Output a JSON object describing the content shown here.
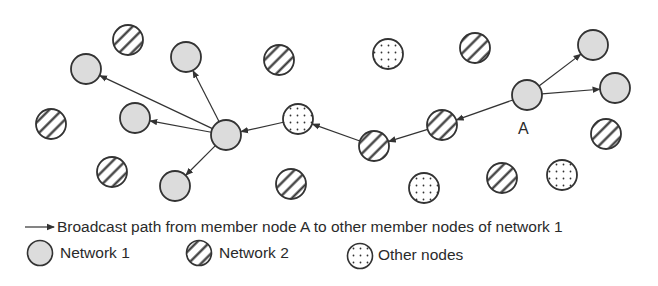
{
  "colors": {
    "stroke": "#333333",
    "network1_fill": "#dcdcdc",
    "background": "#ffffff"
  },
  "node_label_A": "A",
  "nodes": [
    {
      "id": "n1",
      "type": "network2",
      "x": 128,
      "y": 40
    },
    {
      "id": "n2",
      "type": "network1",
      "x": 86,
      "y": 69
    },
    {
      "id": "n3",
      "type": "network1",
      "x": 186,
      "y": 57
    },
    {
      "id": "n4",
      "type": "network2",
      "x": 279,
      "y": 60
    },
    {
      "id": "n5",
      "type": "network2",
      "x": 51,
      "y": 124
    },
    {
      "id": "n6",
      "type": "network1",
      "x": 135,
      "y": 118
    },
    {
      "id": "hub",
      "type": "network1",
      "x": 226,
      "y": 135
    },
    {
      "id": "n8",
      "type": "other",
      "x": 298,
      "y": 119
    },
    {
      "id": "n9",
      "type": "network2",
      "x": 112,
      "y": 172
    },
    {
      "id": "n10",
      "type": "network1",
      "x": 175,
      "y": 186
    },
    {
      "id": "n11",
      "type": "network2",
      "x": 291,
      "y": 184
    },
    {
      "id": "n12",
      "type": "other",
      "x": 388,
      "y": 54
    },
    {
      "id": "n13",
      "type": "network2",
      "x": 475,
      "y": 48
    },
    {
      "id": "A",
      "type": "network1",
      "x": 527,
      "y": 95
    },
    {
      "id": "n15",
      "type": "network1",
      "x": 593,
      "y": 45
    },
    {
      "id": "n16",
      "type": "network1",
      "x": 615,
      "y": 88
    },
    {
      "id": "n17",
      "type": "network2",
      "x": 442,
      "y": 125
    },
    {
      "id": "n18",
      "type": "network2",
      "x": 374,
      "y": 146
    },
    {
      "id": "n19",
      "type": "network2",
      "x": 606,
      "y": 134
    },
    {
      "id": "n20",
      "type": "other",
      "x": 424,
      "y": 188
    },
    {
      "id": "n21",
      "type": "network2",
      "x": 502,
      "y": 178
    },
    {
      "id": "n22",
      "type": "other",
      "x": 562,
      "y": 175
    }
  ],
  "edges": [
    {
      "from": "A",
      "to": "n15"
    },
    {
      "from": "A",
      "to": "n16"
    },
    {
      "from": "A",
      "to": "n17"
    },
    {
      "from": "n17",
      "to": "n18"
    },
    {
      "from": "n18",
      "to": "n8"
    },
    {
      "from": "n8",
      "to": "hub"
    },
    {
      "from": "hub",
      "to": "n2"
    },
    {
      "from": "hub",
      "to": "n3"
    },
    {
      "from": "hub",
      "to": "n6"
    },
    {
      "from": "hub",
      "to": "n10"
    }
  ],
  "legend": {
    "arrow_label": "Broadcast path from member node A to other member nodes of network 1",
    "items": [
      {
        "type": "network1",
        "label": "Network 1"
      },
      {
        "type": "network2",
        "label": "Network 2"
      },
      {
        "type": "other",
        "label": "Other nodes"
      }
    ]
  }
}
